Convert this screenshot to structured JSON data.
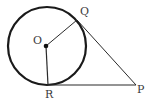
{
  "diagram": {
    "circle": {
      "cx": 47,
      "cy": 46,
      "r": 39,
      "stroke": "#1a1a1a",
      "stroke_width": 2.2
    },
    "points": {
      "O": {
        "label": "O",
        "x": 46,
        "y": 46,
        "label_x": 33,
        "label_y": 44
      },
      "Q": {
        "label": "Q",
        "x": 77,
        "y": 20,
        "label_x": 80,
        "label_y": 15
      },
      "R": {
        "label": "R",
        "x": 48,
        "y": 85,
        "label_x": 45,
        "label_y": 98
      },
      "P": {
        "label": "P",
        "x": 136,
        "y": 85,
        "label_x": 137,
        "label_y": 93
      }
    },
    "segments": [
      {
        "name": "radius-OQ",
        "from": "O",
        "to": "Q"
      },
      {
        "name": "radius-OR",
        "from": "O",
        "to": "R"
      },
      {
        "name": "tangent-QP",
        "from": "Q",
        "to": "P"
      },
      {
        "name": "tangent-RP",
        "from": "R",
        "to": "P"
      }
    ],
    "line_color": "#2a2a2a"
  }
}
